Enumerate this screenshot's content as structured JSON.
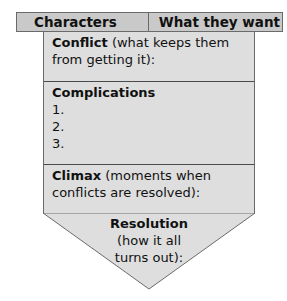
{
  "header": {
    "left_label": "Characters",
    "right_label": "What they want"
  },
  "sections": {
    "conflict": {
      "title": "Conflict",
      "description": " (what keeps them from getting it):"
    },
    "complications": {
      "title": "Complications",
      "items": [
        "1.",
        "2.",
        "3."
      ]
    },
    "climax": {
      "title": "Climax",
      "description": " (moments when conflicts are resolved):"
    },
    "resolution": {
      "title": "Resolution",
      "line1": "(how it all",
      "line2": "turns out):"
    }
  },
  "colors": {
    "header_fill": "#c9c9c9",
    "body_fill": "#dedede",
    "border": "#6a6a6a"
  }
}
